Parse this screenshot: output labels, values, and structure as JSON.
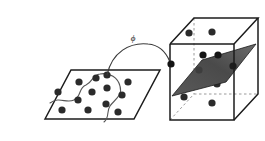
{
  "figure": {
    "map_label": "ϕ",
    "map_label_name": "phi",
    "background_color": "#ffffff"
  },
  "colors": {
    "outline": "#1c1c1c",
    "dot_fill": "#2b2b2b",
    "hyperplane_fill": "#4a4a4a",
    "hyperplane_fill_light": "#6e6e6e",
    "hyperplane_edge": "#1a1a1a",
    "hidden_edge": "#9a9a9a",
    "curve_stroke": "#555555",
    "arrow_stroke": "#3a3a3a",
    "plane_fill": "#ffffff"
  },
  "input_space": {
    "name": "2D input space",
    "shape": "parallelogram",
    "outline_points": "45,119 71,70 160,70 134,119",
    "dot_radius": 3.6,
    "dots": [
      {
        "x": 62,
        "y": 110,
        "class": "a"
      },
      {
        "x": 78,
        "y": 100,
        "class": "a"
      },
      {
        "x": 58,
        "y": 92,
        "class": "a"
      },
      {
        "x": 79,
        "y": 82,
        "class": "b"
      },
      {
        "x": 92,
        "y": 92,
        "class": "b"
      },
      {
        "x": 96,
        "y": 78,
        "class": "b"
      },
      {
        "x": 88,
        "y": 110,
        "class": "b"
      },
      {
        "x": 106,
        "y": 104,
        "class": "b"
      },
      {
        "x": 107,
        "y": 88,
        "class": "b"
      },
      {
        "x": 118,
        "y": 112,
        "class": "a"
      },
      {
        "x": 122,
        "y": 95,
        "class": "a"
      },
      {
        "x": 107,
        "y": 75,
        "class": "a"
      },
      {
        "x": 128,
        "y": 82,
        "class": "a"
      }
    ],
    "boundary": {
      "name": "nonlinear decision boundary",
      "path": "M 50,103 C 60,96 66,104 74,100 C 82,96 78,88 86,85 C 93,82 92,75 100,74 C 110,72 118,78 120,86 C 123,96 114,100 110,106 C 106,112 110,117 104,122",
      "stroke_width": 1.1
    }
  },
  "feature_space": {
    "name": "3D feature space",
    "shape": "cube",
    "cube": {
      "front_face": "170,44 234,44 234,120 170,120",
      "top_face": "170,44 194,18 258,18 234,44",
      "right_face": "234,44 258,18 258,94 234,120",
      "hidden_vertical_edge": "194,18 194,94",
      "hidden_bottom_back_left": "170,120 194,94",
      "hidden_bottom_back_right": "194,94 258,94"
    },
    "hyperplane": {
      "name": "separating hyperplane",
      "points": "172,96 202,60 256,44 226,82",
      "highlight_points": "172,96 202,60 256,44",
      "opacity": 0.95
    },
    "dot_radius": 3.6,
    "dots_above": [
      {
        "x": 189,
        "y": 33
      },
      {
        "x": 212,
        "y": 32
      }
    ],
    "dots_on_plane": [
      {
        "x": 171,
        "y": 64
      },
      {
        "x": 203,
        "y": 55
      },
      {
        "x": 218,
        "y": 55
      },
      {
        "x": 199,
        "y": 70
      },
      {
        "x": 233,
        "y": 66
      }
    ],
    "dots_below": [
      {
        "x": 217,
        "y": 84
      },
      {
        "x": 184,
        "y": 97
      },
      {
        "x": 212,
        "y": 103
      }
    ]
  },
  "mapping_arrow": {
    "name": "phi mapping arrow",
    "path": "M 107,75 C 112,52 130,42 148,44 C 160,45 166,52 170,62",
    "stroke_width": 1.2,
    "source_point": {
      "x": 107,
      "y": 75
    },
    "target_point": {
      "x": 171,
      "y": 64
    }
  }
}
